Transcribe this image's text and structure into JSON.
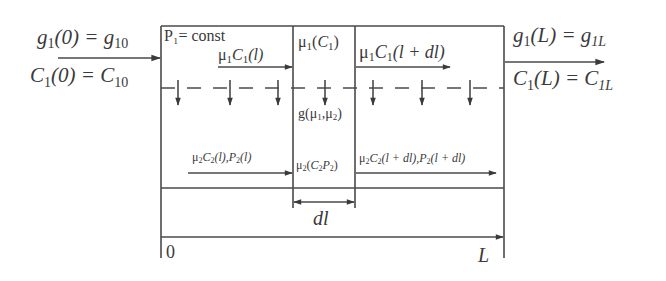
{
  "diagram": {
    "inlet": {
      "top_label": {
        "base": "g",
        "sub": "1",
        "arg": "(0) = ",
        "rhs": "g",
        "rhs_sub": "10"
      },
      "bottom_label": {
        "base": "C",
        "sub": "1",
        "arg": "(0) = ",
        "rhs": "C",
        "rhs_sub": "10"
      }
    },
    "outlet": {
      "top_label": {
        "base": "g",
        "sub": "1",
        "arg": "(L) = ",
        "rhs": "g",
        "rhs_sub": "1L"
      },
      "bottom_label": {
        "base": "C",
        "sub": "1",
        "arg": "(L) = ",
        "rhs": "C",
        "rhs_sub": "1L"
      }
    },
    "box_header": "P₁= const",
    "flow1_in": "μ₁C₁(l)",
    "flow1_out": "μ₁C₁(l + dl)",
    "element_top": "μ₁(C₁)",
    "element_middle": "g(μ₁,μ₂)",
    "element_bottom": "μ₂(C₂P₂)",
    "flow2_in": "μ₂C₂(l),P₂(l)",
    "flow2_out": "μ₂C₂(l + dl),P₂(l + dl)",
    "element_width_label": "dl",
    "axis": {
      "start_label": "0",
      "end_label": "L"
    }
  }
}
